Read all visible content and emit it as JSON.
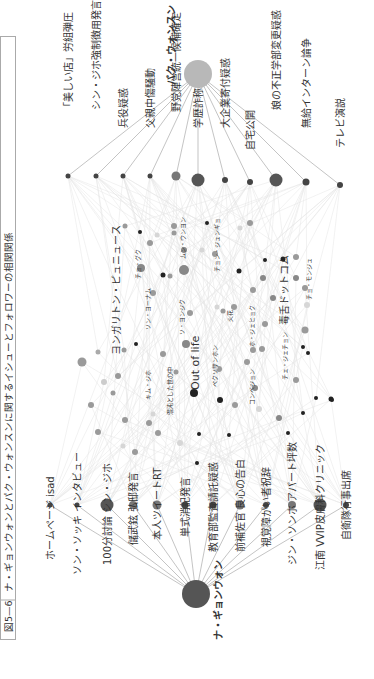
{
  "figure": {
    "number": "図5—6",
    "title": "ナ・ギョンウォンとパク・ウォンスンに関するイシューとフォロワーの相関関係"
  },
  "colors": {
    "hub_na": "#555555",
    "hub_park": "#b8b8b8",
    "edge": "#aaaaaa",
    "faint_edge": "#e4e4e4",
    "node_dark": "#222222",
    "node_mid": "#8c8c8c",
    "node_light": "#d6d6d6"
  },
  "hubs": [
    {
      "id": "na",
      "label": "ナ・ギョンウォン",
      "x": 196,
      "y": 594,
      "r": 14,
      "color": "#555555"
    },
    {
      "id": "park",
      "label": "パク・ウォンスン",
      "x": 198,
      "y": 74,
      "r": 14,
      "color": "#b8b8b8"
    }
  ],
  "na_issues": [
    {
      "label": "ホームページ isad",
      "x": 50,
      "y": 505,
      "r": 2.5,
      "tx": 50,
      "ty": 560
    },
    {
      "label": "ソン・ソッキ インタビュー",
      "x": 77,
      "y": 505,
      "r": 2.5,
      "tx": 77,
      "ty": 575
    },
    {
      "label": "100分討論 シン・ジホ",
      "x": 107,
      "y": 505,
      "r": 6.5,
      "tx": 107,
      "ty": 565
    },
    {
      "label": "儲武鉉 弘邸発言",
      "x": 133,
      "y": 505,
      "r": 4,
      "tx": 133,
      "ty": 545
    },
    {
      "label": "本人ツイートRT",
      "x": 157,
      "y": 505,
      "r": 4.5,
      "tx": 157,
      "ty": 540
    },
    {
      "label": "単式消記発言",
      "x": 185,
      "y": 505,
      "r": 3.5,
      "tx": 185,
      "ty": 537
    },
    {
      "label": "教育部監査請託疑惑",
      "x": 213,
      "y": 505,
      "r": 3.5,
      "tx": 213,
      "ty": 552
    },
    {
      "label": "前補佐官 良心の告白",
      "x": 240,
      "y": 505,
      "r": 4.5,
      "tx": 240,
      "ty": 552
    },
    {
      "label": "視覚障がい者祝辞",
      "x": 266,
      "y": 505,
      "r": 3,
      "tx": 266,
      "ty": 547
    },
    {
      "label": "ジン・ソンホ アパート坪数",
      "x": 292,
      "y": 505,
      "r": 4,
      "tx": 292,
      "ty": 565
    },
    {
      "label": "江南 VVIP皮膚科クリニック",
      "x": 320,
      "y": 505,
      "r": 6.5,
      "tx": 320,
      "ty": 570
    },
    {
      "label": "自衛隊行事出席",
      "x": 346,
      "y": 505,
      "r": 3,
      "tx": 346,
      "ty": 540
    }
  ],
  "park_issues": [
    {
      "label": "「美しい店」労組弾圧",
      "x": 68,
      "y": 176,
      "r": 2.5,
      "tx": 68,
      "ty": 112
    },
    {
      "label": "シン・ジホ強制徴用発言",
      "x": 96,
      "y": 176,
      "r": 2.5,
      "tx": 96,
      "ty": 110
    },
    {
      "label": "兵役疑惑",
      "x": 123,
      "y": 176,
      "r": 2.5,
      "tx": 123,
      "ty": 128
    },
    {
      "label": "父親中傷騒動",
      "x": 150,
      "y": 176,
      "r": 2.5,
      "tx": 150,
      "ty": 128
    },
    {
      "label": "野党陣営統一候補確定",
      "x": 176,
      "y": 176,
      "r": 4.5,
      "tx": 176,
      "ty": 112
    },
    {
      "label": "学歴詐称疑惑",
      "x": 198,
      "y": 180,
      "r": 6.5,
      "tx": 198,
      "ty": 128
    },
    {
      "label": "大企業寄付疑惑",
      "x": 225,
      "y": 180,
      "r": 3,
      "tx": 225,
      "ty": 128
    },
    {
      "label": "自宅公開",
      "x": 250,
      "y": 182,
      "r": 3,
      "tx": 250,
      "ty": 150
    },
    {
      "label": "娘の不正学部変更疑惑",
      "x": 276,
      "y": 180,
      "r": 6.5,
      "tx": 276,
      "ty": 110
    },
    {
      "label": "無給インターン論争",
      "x": 306,
      "y": 182,
      "r": 3.5,
      "tx": 306,
      "ty": 128
    },
    {
      "label": "テレビ演説",
      "x": 340,
      "y": 185,
      "r": 3,
      "tx": 340,
      "ty": 148
    }
  ],
  "center_labels": [
    {
      "label": "ヨンガリトン・ピュニュース",
      "x": 120,
      "y": 355,
      "size": 10
    },
    {
      "label": "Out of life",
      "x": 199,
      "y": 390,
      "size": 11
    },
    {
      "label": "毒舌ドットコム",
      "x": 288,
      "y": 325,
      "size": 10
    },
    {
      "label": "キム・ジホ",
      "x": 150,
      "y": 400,
      "size": 6
    },
    {
      "label": "ソン・ヨーナム",
      "x": 150,
      "y": 330,
      "size": 6
    },
    {
      "label": "チョ・グク",
      "x": 140,
      "y": 279,
      "size": 6
    },
    {
      "label": "ムン・ウンヨン",
      "x": 185,
      "y": 259,
      "size": 6
    },
    {
      "label": "ソ・ヨンジク",
      "x": 184,
      "y": 335,
      "size": 6
    },
    {
      "label": "混沌とした世の中",
      "x": 172,
      "y": 415,
      "size": 6
    },
    {
      "label": "ペクソサンホン",
      "x": 217,
      "y": 387,
      "size": 6
    },
    {
      "label": "火花",
      "x": 232,
      "y": 322,
      "size": 6
    },
    {
      "label": "チョン・ジュンギョ",
      "x": 219,
      "y": 272,
      "size": 6
    },
    {
      "label": "ホ・ジェヒョク",
      "x": 254,
      "y": 347,
      "size": 6
    },
    {
      "label": "コンベジョン",
      "x": 254,
      "y": 405,
      "size": 6
    },
    {
      "label": "チェ・ジェチョン",
      "x": 287,
      "y": 380,
      "size": 6
    },
    {
      "label": "チョ・モンジュ",
      "x": 311,
      "y": 300,
      "size": 6
    }
  ],
  "follower_nodes": [
    {
      "x": 82,
      "y": 362,
      "r": 4.5,
      "c": "#9a9a9a"
    },
    {
      "x": 98,
      "y": 352,
      "r": 2.5,
      "c": "#aaaaaa"
    },
    {
      "x": 104,
      "y": 382,
      "r": 3,
      "c": "#cccccc"
    },
    {
      "x": 91,
      "y": 405,
      "r": 3,
      "c": "#9a9a9a"
    },
    {
      "x": 98,
      "y": 432,
      "r": 3,
      "c": "#9a9a9a"
    },
    {
      "x": 118,
      "y": 376,
      "r": 3,
      "c": "#9a9a9a"
    },
    {
      "x": 113,
      "y": 393,
      "r": 2.5,
      "c": "#9a9a9a"
    },
    {
      "x": 124,
      "y": 350,
      "r": 2.5,
      "c": "#9a9a9a"
    },
    {
      "x": 125,
      "y": 420,
      "r": 3,
      "c": "#9a9a9a"
    },
    {
      "x": 123,
      "y": 446,
      "r": 2.5,
      "c": "#d6d6d6"
    },
    {
      "x": 136,
      "y": 344,
      "r": 2,
      "c": "#222222"
    },
    {
      "x": 135,
      "y": 452,
      "r": 3,
      "c": "#9a9a9a"
    },
    {
      "x": 149,
      "y": 423,
      "r": 3,
      "c": "#9a9a9a"
    },
    {
      "x": 153,
      "y": 414,
      "r": 2.5,
      "c": "#d6d6d6"
    },
    {
      "x": 158,
      "y": 433,
      "r": 3,
      "c": "#9a9a9a"
    },
    {
      "x": 163,
      "y": 354,
      "r": 3,
      "c": "#9a9a9a"
    },
    {
      "x": 186,
      "y": 344,
      "r": 4,
      "c": "#888888"
    },
    {
      "x": 176,
      "y": 372,
      "r": 2.5,
      "c": "#9a9a9a"
    },
    {
      "x": 180,
      "y": 443,
      "r": 3,
      "c": "#d6d6d6"
    },
    {
      "x": 194,
      "y": 393,
      "r": 4,
      "c": "#222222"
    },
    {
      "x": 197,
      "y": 463,
      "r": 2,
      "c": "#222222"
    },
    {
      "x": 199,
      "y": 434,
      "r": 2,
      "c": "#222222"
    },
    {
      "x": 220,
      "y": 400,
      "r": 3,
      "c": "#222222"
    },
    {
      "x": 219,
      "y": 369,
      "r": 3,
      "c": "#9a9a9a"
    },
    {
      "x": 215,
      "y": 367,
      "r": 3,
      "c": "#d6d6d6"
    },
    {
      "x": 229,
      "y": 435,
      "r": 2,
      "c": "#222222"
    },
    {
      "x": 235,
      "y": 405,
      "r": 3,
      "c": "#9a9a9a"
    },
    {
      "x": 247,
      "y": 362,
      "r": 3,
      "c": "#9a9a9a"
    },
    {
      "x": 253,
      "y": 350,
      "r": 3,
      "c": "#9a9a9a"
    },
    {
      "x": 262,
      "y": 349,
      "r": 3,
      "c": "#9a9a9a"
    },
    {
      "x": 255,
      "y": 388,
      "r": 3,
      "c": "#888888"
    },
    {
      "x": 259,
      "y": 409,
      "r": 3,
      "c": "#d6d6d6"
    },
    {
      "x": 279,
      "y": 418,
      "r": 3,
      "c": "#888888"
    },
    {
      "x": 288,
      "y": 433,
      "r": 2,
      "c": "#222222"
    },
    {
      "x": 303,
      "y": 347,
      "r": 2,
      "c": "#222222"
    },
    {
      "x": 303,
      "y": 413,
      "r": 2,
      "c": "#222222"
    },
    {
      "x": 316,
      "y": 398,
      "r": 2,
      "c": "#222222"
    },
    {
      "x": 331,
      "y": 399,
      "r": 2.5,
      "c": "#222222"
    },
    {
      "x": 332,
      "y": 400,
      "r": 2,
      "c": "#222222"
    },
    {
      "x": 125,
      "y": 226,
      "r": 2.5,
      "c": "#9a9a9a"
    },
    {
      "x": 140,
      "y": 232,
      "r": 2,
      "c": "#222222"
    },
    {
      "x": 157,
      "y": 235,
      "r": 2.5,
      "c": "#d6d6d6"
    },
    {
      "x": 163,
      "y": 275,
      "r": 2.5,
      "c": "#222222"
    },
    {
      "x": 174,
      "y": 226,
      "r": 3,
      "c": "#9a9a9a"
    },
    {
      "x": 174,
      "y": 233,
      "r": 2.5,
      "c": "#9a9a9a"
    },
    {
      "x": 150,
      "y": 243,
      "r": 3,
      "c": "#9a9a9a"
    },
    {
      "x": 141,
      "y": 268,
      "r": 4,
      "c": "#888888"
    },
    {
      "x": 153,
      "y": 293,
      "r": 3,
      "c": "#9a9a9a"
    },
    {
      "x": 170,
      "y": 276,
      "r": 2.5,
      "c": "#9a9a9a"
    },
    {
      "x": 184,
      "y": 250,
      "r": 3,
      "c": "#888888"
    },
    {
      "x": 184,
      "y": 270,
      "r": 5,
      "c": "#888888"
    },
    {
      "x": 190,
      "y": 313,
      "r": 3,
      "c": "#9a9a9a"
    },
    {
      "x": 202,
      "y": 250,
      "r": 2.5,
      "c": "#d6d6d6"
    },
    {
      "x": 207,
      "y": 223,
      "r": 2,
      "c": "#222222"
    },
    {
      "x": 215,
      "y": 254,
      "r": 3,
      "c": "#9a9a9a"
    },
    {
      "x": 217,
      "y": 307,
      "r": 2.5,
      "c": "#d6d6d6"
    },
    {
      "x": 223,
      "y": 311,
      "r": 2.5,
      "c": "#9a9a9a"
    },
    {
      "x": 234,
      "y": 307,
      "r": 3,
      "c": "#9a9a9a"
    },
    {
      "x": 239,
      "y": 271,
      "r": 2.5,
      "c": "#222222"
    },
    {
      "x": 240,
      "y": 228,
      "r": 2.5,
      "c": "#d6d6d6"
    },
    {
      "x": 250,
      "y": 223,
      "r": 3,
      "c": "#9a9a9a"
    },
    {
      "x": 253,
      "y": 290,
      "r": 3,
      "c": "#9a9a9a"
    },
    {
      "x": 263,
      "y": 278,
      "r": 3,
      "c": "#888888"
    },
    {
      "x": 265,
      "y": 260,
      "r": 2,
      "c": "#222222"
    },
    {
      "x": 265,
      "y": 324,
      "r": 3,
      "c": "#9a9a9a"
    },
    {
      "x": 273,
      "y": 298,
      "r": 3,
      "c": "#888888"
    },
    {
      "x": 283,
      "y": 259,
      "r": 2.5,
      "c": "#222222"
    },
    {
      "x": 296,
      "y": 278,
      "r": 3,
      "c": "#888888"
    },
    {
      "x": 296,
      "y": 257,
      "r": 3,
      "c": "#9a9a9a"
    },
    {
      "x": 305,
      "y": 288,
      "r": 3,
      "c": "#9a9a9a"
    },
    {
      "x": 305,
      "y": 330,
      "r": 3.5,
      "c": "#9a9a9a"
    },
    {
      "x": 308,
      "y": 353,
      "r": 2,
      "c": "#222222"
    },
    {
      "x": 307,
      "y": 305,
      "r": 3,
      "c": "#d6d6d6"
    },
    {
      "x": 296,
      "y": 380,
      "r": 3,
      "c": "#9a9a9a"
    }
  ]
}
